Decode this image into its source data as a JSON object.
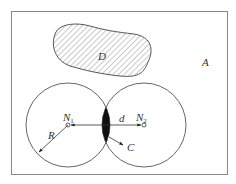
{
  "diagram": {
    "region_label": "A",
    "obstacle_label": "D",
    "node1": {
      "label": "N",
      "subscript": "1"
    },
    "node2": {
      "label": "N",
      "subscript": "2"
    },
    "radius_label": "R",
    "distance_label": "d",
    "overlap_label": "C",
    "colors": {
      "stroke": "#555555",
      "fill_overlap": "#111111",
      "background": "#ffffff"
    }
  }
}
